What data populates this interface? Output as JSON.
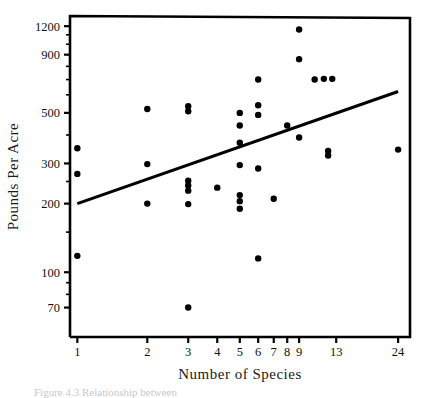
{
  "figure": {
    "caption": "Figure 4.3  Relationship between",
    "xlabel": "Number  of  Species",
    "ylabel": "Pounds  Per  Acre"
  },
  "chart_data": {
    "type": "scatter",
    "title": "",
    "xlabel": "Number of Species",
    "ylabel": "Pounds Per Acre",
    "xscale": "log",
    "yscale": "log",
    "xlim": [
      0.93,
      27
    ],
    "ylim": [
      52,
      1330
    ],
    "grid": false,
    "legend": null,
    "xticks": [
      1,
      2,
      3,
      4,
      5,
      6,
      7,
      8,
      9,
      13,
      24
    ],
    "xtick_labels": [
      "1",
      "2",
      "3",
      "4",
      "5",
      "6",
      "7",
      "8",
      "9",
      "13",
      "24"
    ],
    "yticks": [
      70,
      100,
      200,
      300,
      500,
      900,
      1200
    ],
    "ytick_labels": [
      "70",
      "100",
      "200",
      "300",
      "500",
      "900",
      "1200"
    ],
    "yminor_ticks": [
      80,
      90,
      150,
      250,
      400,
      600,
      700,
      800,
      1000,
      1100
    ],
    "marker": "filled-circle",
    "marker_color": "#000000",
    "points": [
      {
        "x": 1,
        "y": 350
      },
      {
        "x": 1,
        "y": 270
      },
      {
        "x": 1,
        "y": 118
      },
      {
        "x": 2,
        "y": 520
      },
      {
        "x": 2,
        "y": 298
      },
      {
        "x": 2,
        "y": 200
      },
      {
        "x": 3,
        "y": 535
      },
      {
        "x": 3,
        "y": 508
      },
      {
        "x": 3,
        "y": 252
      },
      {
        "x": 3,
        "y": 240
      },
      {
        "x": 3,
        "y": 228
      },
      {
        "x": 3,
        "y": 199
      },
      {
        "x": 3,
        "y": 70
      },
      {
        "x": 4,
        "y": 235
      },
      {
        "x": 5,
        "y": 500
      },
      {
        "x": 5,
        "y": 440
      },
      {
        "x": 5,
        "y": 370
      },
      {
        "x": 5,
        "y": 295
      },
      {
        "x": 5,
        "y": 218
      },
      {
        "x": 5,
        "y": 205
      },
      {
        "x": 5,
        "y": 190
      },
      {
        "x": 6,
        "y": 700
      },
      {
        "x": 6,
        "y": 540
      },
      {
        "x": 6,
        "y": 490
      },
      {
        "x": 6,
        "y": 285
      },
      {
        "x": 6,
        "y": 115
      },
      {
        "x": 7,
        "y": 210
      },
      {
        "x": 8,
        "y": 440
      },
      {
        "x": 9,
        "y": 1160
      },
      {
        "x": 9,
        "y": 860
      },
      {
        "x": 9,
        "y": 390
      },
      {
        "x": 10.5,
        "y": 700
      },
      {
        "x": 11.5,
        "y": 705
      },
      {
        "x": 12.5,
        "y": 705
      },
      {
        "x": 12,
        "y": 340
      },
      {
        "x": 12,
        "y": 325
      },
      {
        "x": 24,
        "y": 345
      }
    ],
    "trendline": {
      "label": "regression line",
      "x_start": 1,
      "y_start": 200,
      "x_end": 24,
      "y_end": 620,
      "color": "#000000"
    }
  }
}
